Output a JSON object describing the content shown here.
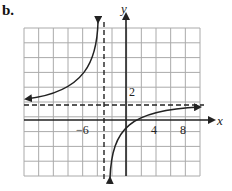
{
  "figure": {
    "label": "b."
  },
  "chart_data": {
    "type": "line",
    "title": "",
    "xlabel": "x",
    "ylabel": "y",
    "x_tick_labels": [
      "-6",
      "4",
      "8"
    ],
    "y_tick_labels": [
      "2"
    ],
    "grid": true,
    "grid_x_units_per_cell": 2,
    "grid_y_units_per_cell": 1,
    "xlim": [
      -12,
      12
    ],
    "ylim": [
      -5,
      5
    ],
    "asymptotes": {
      "vertical": {
        "x": -3,
        "style": "dashed"
      },
      "horizontal": {
        "y": 1,
        "style": "dashed"
      }
    },
    "series": [
      {
        "name": "left branch",
        "x": [
          -12,
          -10,
          -8,
          -6,
          -5,
          -4,
          -3.4
        ],
        "y": [
          1.1,
          1.3,
          1.6,
          2.3,
          3.1,
          4.0,
          5.0
        ]
      },
      {
        "name": "right branch",
        "x": [
          -2.6,
          -2,
          -1,
          0,
          2,
          4,
          6,
          9
        ],
        "y": [
          -3.0,
          -2.2,
          -1.4,
          -0.7,
          0,
          0.4,
          0.6,
          0.8
        ]
      }
    ]
  },
  "axes_labels": {
    "x": "x",
    "y": "y",
    "tick_neg6": "−6",
    "tick_4": "4",
    "tick_8": "8",
    "tick_2": "2"
  }
}
